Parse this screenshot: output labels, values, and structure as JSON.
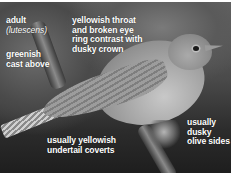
{
  "image": {
    "subject": "warbler perched on branch",
    "palette": {
      "background_dark": "#2a2a2a",
      "background_mid": "#5a5a5a",
      "bird": "#a0a0a0",
      "label_text": "#ffffff",
      "border": "#ffffff"
    }
  },
  "annotations": {
    "age": {
      "line1": "adult",
      "line2": "(lutescens)"
    },
    "upperparts": {
      "line1": "greenish",
      "line2": "cast above"
    },
    "head": {
      "line1": "yellowish throat",
      "line2": "and broken eye",
      "line3": "ring contrast with",
      "line4": "dusky crown"
    },
    "undertail": {
      "line1": "usually yellowish",
      "line2": "undertail coverts"
    },
    "sides": {
      "line1": "usually",
      "line2": "dusky",
      "line3": "olive sides"
    }
  }
}
